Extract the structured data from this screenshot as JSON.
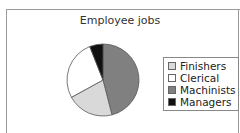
{
  "chart_data": {
    "type": "pie",
    "title": "Employee jobs",
    "categories": [
      "Finishers",
      "Clerical",
      "Machinists",
      "Managers"
    ],
    "values": [
      21,
      27,
      46,
      6
    ],
    "unit": "percent (estimated)",
    "colors": [
      "#d9d9d9",
      "#ffffff",
      "#808080",
      "#111111"
    ],
    "slice_order_clockwise_from_top": [
      "Machinists",
      "Finishers",
      "Clerical",
      "Managers"
    ],
    "legend_position": "right"
  },
  "legend": {
    "items": [
      {
        "label": "Finishers",
        "color": "#d9d9d9"
      },
      {
        "label": "Clerical",
        "color": "#ffffff"
      },
      {
        "label": "Machinists",
        "color": "#808080"
      },
      {
        "label": "Managers",
        "color": "#111111"
      }
    ]
  }
}
